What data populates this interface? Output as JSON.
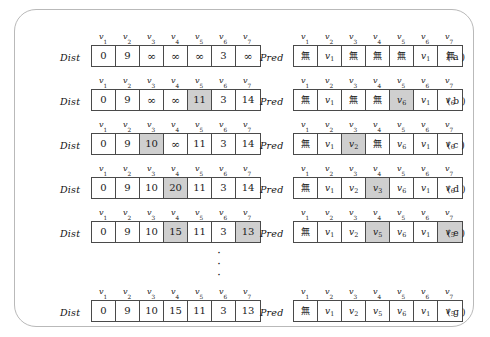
{
  "figure": {
    "dist_label": "Dist",
    "pred_label": "Pred",
    "none_symbol": "無",
    "infinity_symbol": "∞",
    "ellipsis_dot": "·",
    "ellipsis_count": 3,
    "columns": [
      "v1",
      "v2",
      "v3",
      "v4",
      "v5",
      "v6",
      "v7"
    ],
    "column_headers": [
      {
        "base": "v",
        "sub": "1"
      },
      {
        "base": "v",
        "sub": "2"
      },
      {
        "base": "v",
        "sub": "3"
      },
      {
        "base": "v",
        "sub": "4"
      },
      {
        "base": "v",
        "sub": "5"
      },
      {
        "base": "v",
        "sub": "6"
      },
      {
        "base": "v",
        "sub": "7"
      }
    ],
    "shade_color": "#cfcfcf",
    "border_color": "#4a4a4a",
    "frame_color": "#b9b9b9",
    "rows": [
      {
        "stage": "( a )",
        "top": 22,
        "dist": [
          {
            "text": "0",
            "type": "num",
            "shaded": false
          },
          {
            "text": "9",
            "type": "num",
            "shaded": false
          },
          {
            "text": "∞",
            "type": "inf",
            "shaded": false
          },
          {
            "text": "∞",
            "type": "inf",
            "shaded": false
          },
          {
            "text": "∞",
            "type": "inf",
            "shaded": false
          },
          {
            "text": "3",
            "type": "num",
            "shaded": false
          },
          {
            "text": "∞",
            "type": "inf",
            "shaded": false
          }
        ],
        "pred": [
          {
            "text": "無",
            "type": "none",
            "sub": "",
            "shaded": false
          },
          {
            "text": "v",
            "type": "var",
            "sub": "1",
            "shaded": false
          },
          {
            "text": "無",
            "type": "none",
            "sub": "",
            "shaded": false
          },
          {
            "text": "無",
            "type": "none",
            "sub": "",
            "shaded": false
          },
          {
            "text": "無",
            "type": "none",
            "sub": "",
            "shaded": false
          },
          {
            "text": "v",
            "type": "var",
            "sub": "1",
            "shaded": false
          },
          {
            "text": "無",
            "type": "none",
            "sub": "",
            "shaded": false
          }
        ]
      },
      {
        "stage": "( b )",
        "top": 66,
        "dist": [
          {
            "text": "0",
            "type": "num",
            "shaded": false
          },
          {
            "text": "9",
            "type": "num",
            "shaded": false
          },
          {
            "text": "∞",
            "type": "inf",
            "shaded": false
          },
          {
            "text": "∞",
            "type": "inf",
            "shaded": false
          },
          {
            "text": "11",
            "type": "num",
            "shaded": true
          },
          {
            "text": "3",
            "type": "num",
            "shaded": false
          },
          {
            "text": "14",
            "type": "num",
            "shaded": false
          }
        ],
        "pred": [
          {
            "text": "無",
            "type": "none",
            "sub": "",
            "shaded": false
          },
          {
            "text": "v",
            "type": "var",
            "sub": "1",
            "shaded": false
          },
          {
            "text": "無",
            "type": "none",
            "sub": "",
            "shaded": false
          },
          {
            "text": "無",
            "type": "none",
            "sub": "",
            "shaded": false
          },
          {
            "text": "v",
            "type": "var",
            "sub": "6",
            "shaded": true
          },
          {
            "text": "v",
            "type": "var",
            "sub": "1",
            "shaded": false
          },
          {
            "text": "v",
            "type": "var",
            "sub": "6",
            "shaded": false
          }
        ]
      },
      {
        "stage": "( c )",
        "top": 110,
        "dist": [
          {
            "text": "0",
            "type": "num",
            "shaded": false
          },
          {
            "text": "9",
            "type": "num",
            "shaded": false
          },
          {
            "text": "10",
            "type": "num",
            "shaded": true
          },
          {
            "text": "∞",
            "type": "inf",
            "shaded": false
          },
          {
            "text": "11",
            "type": "num",
            "shaded": false
          },
          {
            "text": "3",
            "type": "num",
            "shaded": false
          },
          {
            "text": "14",
            "type": "num",
            "shaded": false
          }
        ],
        "pred": [
          {
            "text": "無",
            "type": "none",
            "sub": "",
            "shaded": false
          },
          {
            "text": "v",
            "type": "var",
            "sub": "1",
            "shaded": false
          },
          {
            "text": "v",
            "type": "var",
            "sub": "2",
            "shaded": true
          },
          {
            "text": "無",
            "type": "none",
            "sub": "",
            "shaded": false
          },
          {
            "text": "v",
            "type": "var",
            "sub": "6",
            "shaded": false
          },
          {
            "text": "v",
            "type": "var",
            "sub": "1",
            "shaded": false
          },
          {
            "text": "v",
            "type": "var",
            "sub": "6",
            "shaded": false
          }
        ]
      },
      {
        "stage": "( d )",
        "top": 154,
        "dist": [
          {
            "text": "0",
            "type": "num",
            "shaded": false
          },
          {
            "text": "9",
            "type": "num",
            "shaded": false
          },
          {
            "text": "10",
            "type": "num",
            "shaded": false
          },
          {
            "text": "20",
            "type": "num",
            "shaded": true
          },
          {
            "text": "11",
            "type": "num",
            "shaded": false
          },
          {
            "text": "3",
            "type": "num",
            "shaded": false
          },
          {
            "text": "14",
            "type": "num",
            "shaded": false
          }
        ],
        "pred": [
          {
            "text": "無",
            "type": "none",
            "sub": "",
            "shaded": false
          },
          {
            "text": "v",
            "type": "var",
            "sub": "1",
            "shaded": false
          },
          {
            "text": "v",
            "type": "var",
            "sub": "2",
            "shaded": false
          },
          {
            "text": "v",
            "type": "var",
            "sub": "3",
            "shaded": true
          },
          {
            "text": "v",
            "type": "var",
            "sub": "6",
            "shaded": false
          },
          {
            "text": "v",
            "type": "var",
            "sub": "1",
            "shaded": false
          },
          {
            "text": "v",
            "type": "var",
            "sub": "6",
            "shaded": false
          }
        ]
      },
      {
        "stage": "( e )",
        "top": 198,
        "dist": [
          {
            "text": "0",
            "type": "num",
            "shaded": false
          },
          {
            "text": "9",
            "type": "num",
            "shaded": false
          },
          {
            "text": "10",
            "type": "num",
            "shaded": false
          },
          {
            "text": "15",
            "type": "num",
            "shaded": true
          },
          {
            "text": "11",
            "type": "num",
            "shaded": false
          },
          {
            "text": "3",
            "type": "num",
            "shaded": false
          },
          {
            "text": "13",
            "type": "num",
            "shaded": true
          }
        ],
        "pred": [
          {
            "text": "無",
            "type": "none",
            "sub": "",
            "shaded": false
          },
          {
            "text": "v",
            "type": "var",
            "sub": "1",
            "shaded": false
          },
          {
            "text": "v",
            "type": "var",
            "sub": "2",
            "shaded": false
          },
          {
            "text": "v",
            "type": "var",
            "sub": "5",
            "shaded": true
          },
          {
            "text": "v",
            "type": "var",
            "sub": "6",
            "shaded": false
          },
          {
            "text": "v",
            "type": "var",
            "sub": "1",
            "shaded": false
          },
          {
            "text": "v",
            "type": "var",
            "sub": "5",
            "shaded": true
          }
        ]
      },
      {
        "stage": "( g )",
        "top": 277,
        "dist": [
          {
            "text": "0",
            "type": "num",
            "shaded": false
          },
          {
            "text": "9",
            "type": "num",
            "shaded": false
          },
          {
            "text": "10",
            "type": "num",
            "shaded": false
          },
          {
            "text": "15",
            "type": "num",
            "shaded": false
          },
          {
            "text": "11",
            "type": "num",
            "shaded": false
          },
          {
            "text": "3",
            "type": "num",
            "shaded": false
          },
          {
            "text": "13",
            "type": "num",
            "shaded": false
          }
        ],
        "pred": [
          {
            "text": "無",
            "type": "none",
            "sub": "",
            "shaded": false
          },
          {
            "text": "v",
            "type": "var",
            "sub": "1",
            "shaded": false
          },
          {
            "text": "v",
            "type": "var",
            "sub": "2",
            "shaded": false
          },
          {
            "text": "v",
            "type": "var",
            "sub": "5",
            "shaded": false
          },
          {
            "text": "v",
            "type": "var",
            "sub": "6",
            "shaded": false
          },
          {
            "text": "v",
            "type": "var",
            "sub": "1",
            "shaded": false
          },
          {
            "text": "v",
            "type": "var",
            "sub": "5",
            "shaded": false
          }
        ]
      }
    ]
  }
}
